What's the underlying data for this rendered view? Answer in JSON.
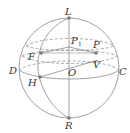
{
  "diagram": {
    "type": "sphere-geometry",
    "colors": {
      "line": "#8a8a8a",
      "dot": "#7a7a7a",
      "text": "#333333"
    },
    "points": {
      "L": {
        "label": "L"
      },
      "R": {
        "label": "R"
      },
      "D": {
        "label": "D"
      },
      "C": {
        "label": "C"
      },
      "F": {
        "label": "F"
      },
      "H": {
        "label": "H"
      },
      "P": {
        "label": "P"
      },
      "P1": {
        "label": "P",
        "subscript": "1"
      },
      "O": {
        "label": "O"
      },
      "V": {
        "label": "V"
      }
    },
    "elements": [
      "outer circle (sphere outline)",
      "vertical axis L–R",
      "meridian arc through L, F, H, R",
      "equator ellipse through D, H, C (front solid, back dashed)",
      "latitude small circle through F and P (front solid, back dashed)",
      "upper latitude ellipse (dashed back)",
      "segments F–P1, P1–P, H–V–O line"
    ]
  }
}
